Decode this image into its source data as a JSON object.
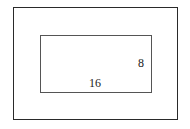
{
  "diagram": {
    "type": "nested-rectangles",
    "outer_rectangle": {
      "label": ""
    },
    "inner_rectangle": {
      "width_label": "16",
      "height_label": "8"
    },
    "colors": {
      "outer_border": "#2a2a2a",
      "inner_border": "#555555",
      "background": "#ffffff"
    }
  }
}
